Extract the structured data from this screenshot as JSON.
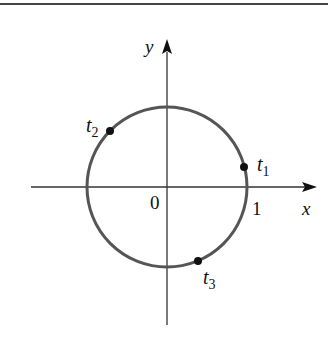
{
  "figure": {
    "colors": {
      "circle": "#555555",
      "axes": "#333333",
      "points": "#111111",
      "rule": "#444444",
      "background": "#ffffff"
    },
    "axes": {
      "x_label": "x",
      "y_label": "y",
      "origin_label": "0",
      "x_tick_label": "1"
    },
    "circle": {
      "center": [
        0,
        0
      ],
      "radius": 1
    },
    "points": [
      {
        "name": "t",
        "sub": "1",
        "approx_angle_deg": 15
      },
      {
        "name": "t",
        "sub": "2",
        "approx_angle_deg": 135
      },
      {
        "name": "t",
        "sub": "3",
        "approx_angle_deg": 293
      }
    ]
  }
}
